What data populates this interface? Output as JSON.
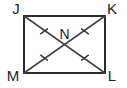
{
  "figure": {
    "kind": "rectangle-with-diagonals",
    "canvas": {
      "width": 127,
      "height": 88
    },
    "background_color": "#ffffff",
    "edge_color": "#2b2b2b",
    "diagonal_color": "#444444",
    "tick_color": "#3a3a3a",
    "label_color": "#1e1e1e",
    "vertices": [
      {
        "name": "J",
        "label": "J",
        "x": 24,
        "y": 16,
        "label_x": 16,
        "label_y": 14
      },
      {
        "name": "K",
        "label": "K",
        "x": 105,
        "y": 16,
        "label_x": 108,
        "label_y": 14
      },
      {
        "name": "L",
        "label": "L",
        "x": 105,
        "y": 73,
        "label_x": 108,
        "label_y": 79
      },
      {
        "name": "M",
        "label": "M",
        "x": 24,
        "y": 73,
        "label_x": 11,
        "label_y": 79
      }
    ],
    "interior_points": [
      {
        "name": "N",
        "label": "N",
        "x": 64.5,
        "y": 44.5,
        "label_x": 64.5,
        "label_y": 37
      }
    ],
    "diagonals": [
      {
        "name": "diagonal-jl",
        "from": "J",
        "to": "L"
      },
      {
        "name": "diagonal-km",
        "from": "K",
        "to": "M"
      }
    ],
    "tick_marks": [
      {
        "name": "tick-segment-jn",
        "segment": "JN",
        "count": 1,
        "x": 44,
        "y": 30
      },
      {
        "name": "tick-segment-nk",
        "segment": "NK",
        "count": 1,
        "x": 85,
        "y": 30
      },
      {
        "name": "tick-segment-mn",
        "segment": "MN",
        "count": 1,
        "x": 44,
        "y": 59
      },
      {
        "name": "tick-segment-nl",
        "segment": "NL",
        "count": 1,
        "x": 85,
        "y": 59
      }
    ]
  }
}
